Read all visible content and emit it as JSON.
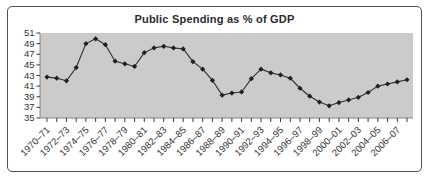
{
  "figure": {
    "title": "Public Spending as % of GDP"
  },
  "chart_data": {
    "type": "line",
    "title": "Public Spending as % of GDP",
    "xlabel": "",
    "ylabel": "",
    "ylim": [
      35,
      51
    ],
    "y_ticks": [
      35,
      37,
      39,
      41,
      43,
      45,
      47,
      49,
      51
    ],
    "grid": false,
    "legend_position": "none",
    "marker": "diamond",
    "x_label_every": 2,
    "categories": [
      "1970–71",
      "1971–72",
      "1972–73",
      "1973–74",
      "1974–75",
      "1975–76",
      "1976–77",
      "1977–78",
      "1978–79",
      "1979–80",
      "1980–81",
      "1981–82",
      "1982–83",
      "1983–84",
      "1984–85",
      "1985–86",
      "1986–87",
      "1987–88",
      "1988–89",
      "1989–90",
      "1990–91",
      "1991–92",
      "1992–93",
      "1993–94",
      "1994–95",
      "1995–96",
      "1996–97",
      "1997–98",
      "1998–99",
      "1999–00",
      "2000–01",
      "2001–02",
      "2002–03",
      "2003–04",
      "2004–05",
      "2005–06",
      "2006–07",
      "2007–08"
    ],
    "values": [
      42.7,
      42.5,
      42.0,
      44.5,
      49.0,
      49.9,
      48.8,
      45.7,
      45.2,
      44.7,
      47.3,
      48.2,
      48.5,
      48.2,
      48.0,
      45.6,
      44.2,
      42.1,
      39.3,
      39.7,
      39.9,
      42.4,
      44.2,
      43.5,
      43.1,
      42.5,
      40.6,
      39.1,
      38.0,
      37.3,
      37.9,
      38.4,
      38.9,
      39.8,
      41.0,
      41.4,
      41.8,
      42.2
    ],
    "colors": {
      "line": "#2f2f2f",
      "marker": "#1f1f1f",
      "panel_bg": "#cbcbcb",
      "axis": "#6e6e6e",
      "tick": "#3a3a3a",
      "text": "#333333",
      "figure_border": "#4f4f4f"
    }
  }
}
